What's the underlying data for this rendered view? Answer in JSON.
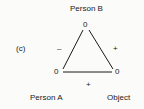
{
  "diagram": {
    "panel_label": "(c)",
    "nodes": {
      "top": {
        "label": "Person B",
        "value": "0"
      },
      "left": {
        "label": "Person A",
        "value": "0"
      },
      "right": {
        "label": "Object",
        "value": "0"
      }
    },
    "edges": {
      "left_side": {
        "from": "Person A",
        "to": "Person B",
        "sign": "–"
      },
      "right_side": {
        "from": "Person B",
        "to": "Object",
        "sign": "+"
      },
      "bottom": {
        "from": "Person A",
        "to": "Object",
        "sign": "+"
      }
    }
  }
}
